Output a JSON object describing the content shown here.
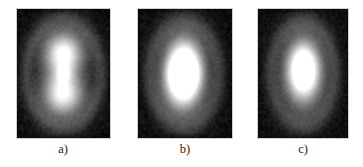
{
  "figure": {
    "name": "three-panel-beam-intensity-profiles",
    "background_color": "#ffffff",
    "width": 363,
    "height": 167,
    "label_color": "#1b1b1b",
    "panel_border_color": "#8a8a8a"
  },
  "panels": [
    {
      "label": "a)",
      "id": "panel-a",
      "description": "two-lobed vertical dumbbell intensity pattern with dark waist and faint outer halo ring",
      "background_color": "#050505",
      "peak_color": "#ffffff",
      "x": 17,
      "y": 9,
      "width": 93,
      "height": 129
    },
    {
      "label": "b)",
      "id": "panel-b",
      "description": "single elongated vertical intensity blob with partially merged lobes and faint outer halo",
      "background_color": "#050505",
      "peak_color": "#ffffff",
      "x": 138,
      "y": 9,
      "width": 94,
      "height": 129
    },
    {
      "label": "c)",
      "id": "panel-c",
      "description": "single compact vertical oval intensity spot with faint outer halo",
      "background_color": "#050505",
      "peak_color": "#ffffff",
      "x": 258,
      "y": 9,
      "width": 90,
      "height": 129
    }
  ],
  "chart_data": {
    "type": "heatmap",
    "title": "",
    "subtitle": "",
    "xlabel": "",
    "ylabel": "",
    "grid": false,
    "legend_position": "none",
    "colormap": "grayscale",
    "colormap_range": [
      0,
      255
    ],
    "annotations": [
      "a)",
      "b)",
      "c)"
    ],
    "panel_count": 3,
    "panels": [
      {
        "label": "a)",
        "xlim": [
          0,
          1
        ],
        "ylim": [
          0,
          1
        ],
        "noise_amplitude": 0.055,
        "halo": {
          "cx": 0.5,
          "cy": 0.5,
          "rx": 0.4,
          "ry": 0.42,
          "amplitude": 0.16,
          "thickness": 0.13
        },
        "lobes": [
          {
            "cx": 0.5,
            "cy": 0.345,
            "sx": 0.145,
            "sy": 0.115,
            "amplitude": 1.0
          },
          {
            "cx": 0.495,
            "cy": 0.655,
            "sx": 0.15,
            "sy": 0.12,
            "amplitude": 0.97
          },
          {
            "cx": 0.5,
            "cy": 0.5,
            "sx": 0.055,
            "sy": 0.045,
            "amplitude": 0.3
          }
        ]
      },
      {
        "label": "b)",
        "xlim": [
          0,
          1
        ],
        "ylim": [
          0,
          1
        ],
        "noise_amplitude": 0.055,
        "halo": {
          "cx": 0.49,
          "cy": 0.5,
          "rx": 0.37,
          "ry": 0.41,
          "amplitude": 0.15,
          "thickness": 0.14
        },
        "lobes": [
          {
            "cx": 0.49,
            "cy": 0.375,
            "sx": 0.135,
            "sy": 0.13,
            "amplitude": 0.92
          },
          {
            "cx": 0.48,
            "cy": 0.615,
            "sx": 0.14,
            "sy": 0.135,
            "amplitude": 1.0
          },
          {
            "cx": 0.485,
            "cy": 0.5,
            "sx": 0.115,
            "sy": 0.09,
            "amplitude": 0.78
          }
        ]
      },
      {
        "label": "c)",
        "xlim": [
          0,
          1
        ],
        "ylim": [
          0,
          1
        ],
        "noise_amplitude": 0.05,
        "halo": {
          "cx": 0.5,
          "cy": 0.5,
          "rx": 0.36,
          "ry": 0.4,
          "amplitude": 0.15,
          "thickness": 0.14
        },
        "lobes": [
          {
            "cx": 0.505,
            "cy": 0.495,
            "sx": 0.145,
            "sy": 0.18,
            "amplitude": 1.0
          },
          {
            "cx": 0.505,
            "cy": 0.455,
            "sx": 0.1,
            "sy": 0.12,
            "amplitude": 0.55
          }
        ]
      }
    ]
  }
}
